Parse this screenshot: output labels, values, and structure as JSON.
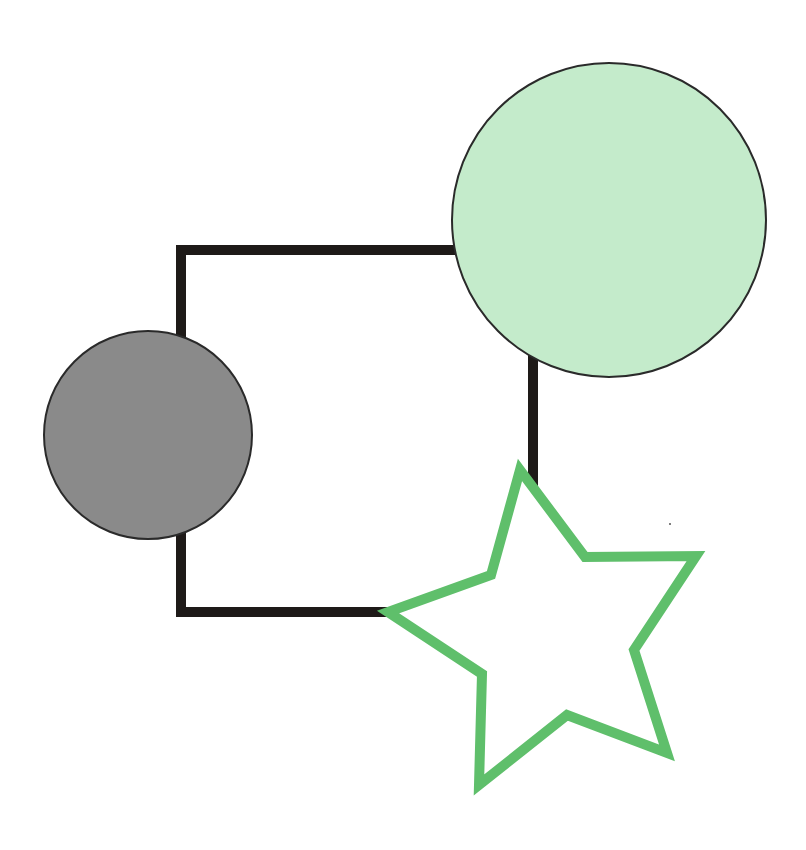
{
  "canvas": {
    "width": 806,
    "height": 850,
    "background": "#ffffff"
  },
  "shapes": {
    "square": {
      "label": "square-outline",
      "x": 181,
      "y": 250,
      "width": 352,
      "height": 362,
      "stroke": "#1e1a18",
      "stroke_width": 10,
      "fill": "none"
    },
    "gray_circle": {
      "label": "gray-circle",
      "cx": 148,
      "cy": 435,
      "r": 104,
      "fill": "#8a8a8a",
      "stroke": "#2a2a2a",
      "stroke_width": 2
    },
    "green_circle": {
      "label": "light-green-circle",
      "cx": 609,
      "cy": 220,
      "r": 157,
      "fill": "#c4ebcb",
      "stroke": "#2a2a2a",
      "stroke_width": 2
    },
    "star": {
      "label": "green-star-outline",
      "points": "520,470 585,557 696,556 634,650 667,753 567,715 479,785 482,674 388,612 491,575",
      "stroke": "#5fbf6b",
      "stroke_width": 10,
      "fill": "#ffffff"
    }
  }
}
